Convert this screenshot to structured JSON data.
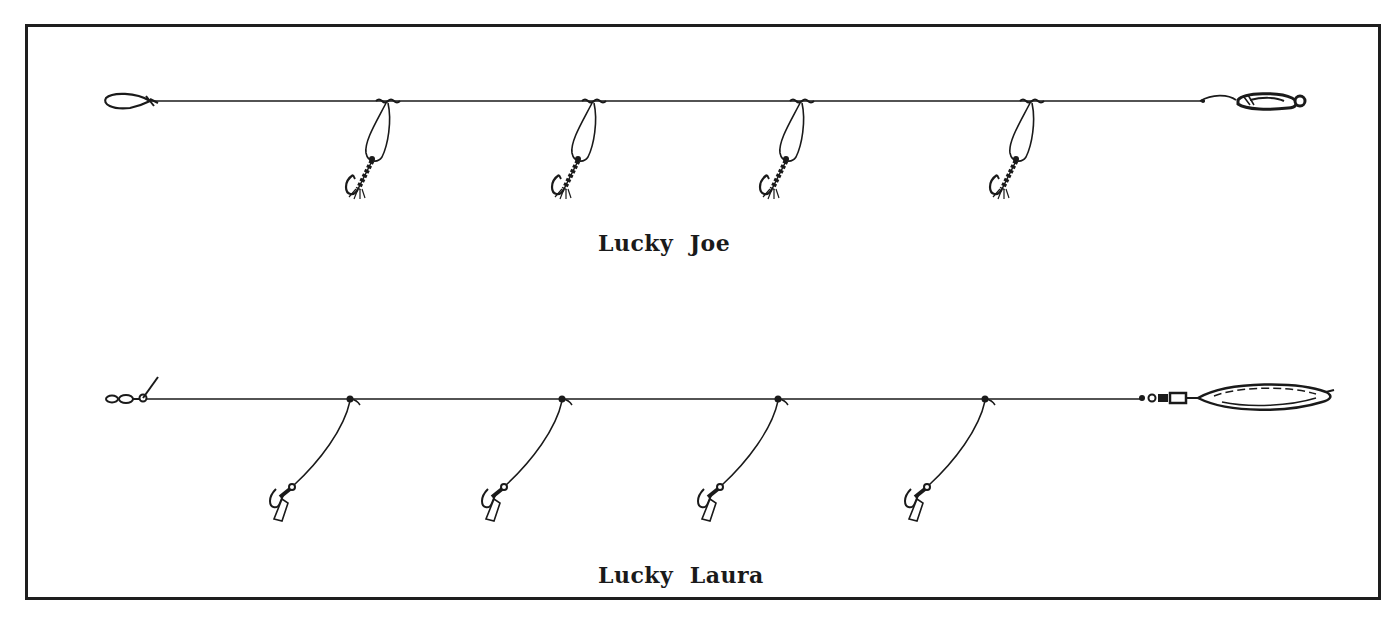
{
  "figure": {
    "border_color": "#1e1e1e",
    "ink_color": "#1a1a1a",
    "background": "#ffffff"
  },
  "rigs": [
    {
      "name": "Lucky Joe",
      "caption": "Lucky  Joe",
      "mainline_y": 101,
      "mainline_x_start": 150,
      "mainline_x_end": 1205,
      "top_end": "loop",
      "bottom_end": "spoon",
      "dropper_style": "loop-with-dressed-treble",
      "dropper_x": [
        386,
        592,
        800,
        1030
      ]
    },
    {
      "name": "Lucky Laura",
      "caption": "Lucky  Laura",
      "mainline_y": 399,
      "mainline_x_start": 140,
      "mainline_x_end": 1140,
      "top_end": "swivel-with-tag",
      "bottom_end": "swivel-and-elongated-spoon",
      "dropper_style": "snood-with-single-hook-and-tab",
      "dropper_x": [
        350,
        562,
        778,
        985
      ]
    }
  ]
}
